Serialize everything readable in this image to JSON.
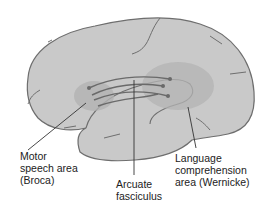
{
  "diagram": {
    "type": "anatomical-illustration",
    "colors": {
      "brain_fill": "#c9c9c9",
      "outline": "#6e6e6e",
      "area_shade": "#b3b3b3",
      "fibers": "#6a6a6a",
      "leader": "#333333"
    },
    "labels": {
      "broca": [
        "Motor",
        "speech area",
        "(Broca)"
      ],
      "arcuate": [
        "Arcuate",
        "fasciculus"
      ],
      "wernicke": [
        "Language",
        "comprehension",
        "area (Wernicke)"
      ]
    }
  }
}
